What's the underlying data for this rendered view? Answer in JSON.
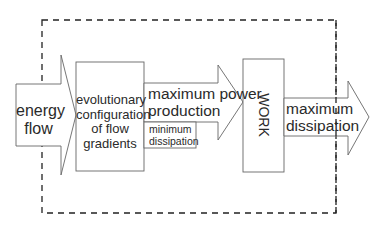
{
  "diagram": {
    "boundary": {
      "style": "dashed",
      "color": "#222222"
    },
    "nodes": {
      "energy_flow": {
        "label_line1": "energy",
        "label_line2": "flow",
        "shape": "arrow-right"
      },
      "evolutionary_config": {
        "label_line1": "evolutionary",
        "label_line2": "configuration",
        "label_line3": "of flow",
        "label_line4": "gradients",
        "shape": "box"
      },
      "max_power": {
        "label_line1": "maximum power",
        "label_line2": "production",
        "shape": "arrow-right"
      },
      "min_dissipation": {
        "label_line1": "minimum",
        "label_line2": "dissipation",
        "shape": "box"
      },
      "work": {
        "label": "WORK",
        "shape": "box",
        "text_orientation": "vertical"
      },
      "max_dissipation": {
        "label_line1": "maximum",
        "label_line2": "dissipation",
        "shape": "arrow-right"
      }
    },
    "colors": {
      "stroke": "#555555",
      "fill": "#ffffff",
      "text": "#2a2a2a"
    }
  }
}
